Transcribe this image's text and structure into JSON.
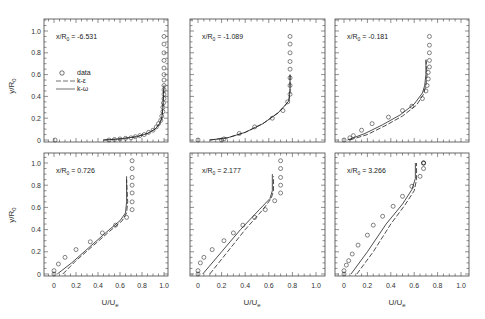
{
  "figure": {
    "ylabel": "y/R",
    "ylabel_sub": "0",
    "xlabel": "U/U",
    "xlabel_sub": "e",
    "legend": {
      "items": [
        {
          "label": "data",
          "style": "circle"
        },
        {
          "label": "k-ε",
          "style": "dashed"
        },
        {
          "label": "k-ω",
          "style": "solid"
        }
      ]
    }
  },
  "chart_data": [
    {
      "type": "line",
      "title": "x/R0 = -6.531",
      "annotation": "x/R",
      "annotation_sub": "0",
      "annotation_value": " = -6.531",
      "xlabel": "",
      "ylabel": "y/R0",
      "xlim": [
        -0.08,
        1.05
      ],
      "ylim": [
        0,
        1.1
      ],
      "yticks": [
        0,
        0.2,
        0.4,
        0.6,
        0.8,
        1.0
      ],
      "grid": false,
      "series": [
        {
          "name": "data",
          "x": [
            0.01,
            0.5,
            0.55,
            0.6,
            0.65,
            0.7,
            0.74,
            0.78,
            0.82,
            0.86,
            0.9,
            0.93,
            0.95,
            0.97,
            0.98,
            0.99,
            0.99,
            0.995,
            1.0,
            1.0,
            1.0,
            1.0,
            1.0,
            1.0,
            1.0,
            1.0,
            1.0,
            1.0,
            1.0
          ],
          "y": [
            0.0,
            0.0,
            0.005,
            0.01,
            0.015,
            0.02,
            0.03,
            0.04,
            0.05,
            0.07,
            0.09,
            0.12,
            0.15,
            0.18,
            0.22,
            0.26,
            0.3,
            0.34,
            0.38,
            0.42,
            0.46,
            0.5,
            0.55,
            0.6,
            0.66,
            0.73,
            0.8,
            0.88,
            0.95
          ]
        },
        {
          "name": "k-ε",
          "x": [
            0.45,
            0.6,
            0.75,
            0.85,
            0.92,
            0.96,
            0.98,
            0.99,
            0.995,
            1.0
          ],
          "y": [
            0.0,
            0.01,
            0.03,
            0.06,
            0.1,
            0.15,
            0.2,
            0.3,
            0.4,
            0.5
          ]
        },
        {
          "name": "k-ω",
          "x": [
            0.45,
            0.6,
            0.75,
            0.85,
            0.92,
            0.96,
            0.98,
            0.99,
            0.995,
            1.0
          ],
          "y": [
            0.0,
            0.01,
            0.03,
            0.06,
            0.1,
            0.15,
            0.2,
            0.3,
            0.4,
            0.5
          ]
        }
      ]
    },
    {
      "type": "line",
      "title": "x/R0 = -1.089",
      "annotation": "x/R",
      "annotation_sub": "0",
      "annotation_value": " = -1.089",
      "xlim": [
        -0.08,
        1.05
      ],
      "ylim": [
        0,
        1.1
      ],
      "series": [
        {
          "name": "data",
          "x": [
            0.0,
            0.2,
            0.22,
            0.35,
            0.48,
            0.63,
            0.72,
            0.76,
            0.78,
            0.78,
            0.78,
            0.78,
            0.78,
            0.78,
            0.78,
            0.78
          ],
          "y": [
            0.0,
            0.0,
            0.01,
            0.06,
            0.12,
            0.2,
            0.27,
            0.35,
            0.42,
            0.5,
            0.57,
            0.65,
            0.72,
            0.8,
            0.88,
            0.95
          ]
        },
        {
          "name": "k-ε",
          "x": [
            0.1,
            0.25,
            0.4,
            0.55,
            0.68,
            0.74,
            0.77,
            0.78,
            0.78
          ],
          "y": [
            0.0,
            0.02,
            0.07,
            0.15,
            0.25,
            0.32,
            0.36,
            0.45,
            0.6
          ]
        },
        {
          "name": "k-ω",
          "x": [
            0.1,
            0.25,
            0.4,
            0.55,
            0.68,
            0.74,
            0.77,
            0.78,
            0.78
          ],
          "y": [
            0.0,
            0.02,
            0.07,
            0.15,
            0.25,
            0.32,
            0.36,
            0.45,
            0.6
          ]
        }
      ]
    },
    {
      "type": "line",
      "title": "x/R0 = -0.181",
      "annotation": "x/R",
      "annotation_sub": "0",
      "annotation_value": " = -0.181",
      "xlim": [
        -0.08,
        1.05
      ],
      "ylim": [
        0,
        1.1
      ],
      "series": [
        {
          "name": "data",
          "x": [
            0.0,
            0.05,
            0.08,
            0.15,
            0.24,
            0.38,
            0.5,
            0.58,
            0.67,
            0.7,
            0.71,
            0.72,
            0.72,
            0.73,
            0.73,
            0.73,
            0.73,
            0.73
          ],
          "y": [
            0.0,
            0.02,
            0.04,
            0.09,
            0.15,
            0.21,
            0.27,
            0.31,
            0.38,
            0.45,
            0.5,
            0.56,
            0.62,
            0.67,
            0.73,
            0.8,
            0.87,
            0.95
          ]
        },
        {
          "name": "k-ε",
          "x": [
            0.05,
            0.2,
            0.35,
            0.5,
            0.62,
            0.68,
            0.7,
            0.71,
            0.7
          ],
          "y": [
            0.0,
            0.05,
            0.13,
            0.22,
            0.32,
            0.42,
            0.5,
            0.6,
            0.75
          ]
        },
        {
          "name": "k-ω",
          "x": [
            0.03,
            0.18,
            0.33,
            0.48,
            0.6,
            0.67,
            0.69,
            0.7,
            0.7
          ],
          "y": [
            0.0,
            0.06,
            0.14,
            0.23,
            0.33,
            0.43,
            0.5,
            0.6,
            0.73
          ]
        }
      ]
    },
    {
      "type": "line",
      "title": "x/R0 = 0.726",
      "annotation": "x/R",
      "annotation_sub": "0",
      "annotation_value": " = 0.726",
      "xlim": [
        -0.08,
        1.05
      ],
      "ylim": [
        0,
        1.1
      ],
      "xticks": [
        0,
        0.2,
        0.4,
        0.6,
        0.8,
        1.0
      ],
      "series": [
        {
          "name": "data",
          "x": [
            0.0,
            0.0,
            0.04,
            0.1,
            0.2,
            0.33,
            0.44,
            0.56,
            0.66,
            0.71,
            0.71,
            0.71,
            0.71,
            0.71,
            0.71,
            0.71
          ],
          "y": [
            0.0,
            0.03,
            0.09,
            0.15,
            0.22,
            0.29,
            0.37,
            0.44,
            0.51,
            0.58,
            0.65,
            0.73,
            0.8,
            0.87,
            0.95,
            1.02
          ]
        },
        {
          "name": "k-ε",
          "x": [
            0.08,
            0.2,
            0.35,
            0.5,
            0.62,
            0.66,
            0.67,
            0.66
          ],
          "y": [
            0.0,
            0.12,
            0.25,
            0.38,
            0.48,
            0.55,
            0.65,
            0.85
          ]
        },
        {
          "name": "k-ω",
          "x": [
            0.03,
            0.16,
            0.32,
            0.48,
            0.6,
            0.65,
            0.66,
            0.66
          ],
          "y": [
            0.0,
            0.1,
            0.24,
            0.38,
            0.48,
            0.55,
            0.65,
            0.88
          ]
        }
      ]
    },
    {
      "type": "line",
      "title": "x/R0 = 2.177",
      "annotation": "x/R",
      "annotation_sub": "0",
      "annotation_value": " = 2.177",
      "xlim": [
        -0.08,
        1.05
      ],
      "ylim": [
        0,
        1.1
      ],
      "xticks": [
        0,
        0.2,
        0.4,
        0.6,
        0.8,
        1.0
      ],
      "series": [
        {
          "name": "data",
          "x": [
            0.0,
            0.0,
            0.02,
            0.05,
            0.12,
            0.22,
            0.3,
            0.38,
            0.48,
            0.57,
            0.65,
            0.7,
            0.7,
            0.7,
            0.7,
            0.7
          ],
          "y": [
            0.0,
            0.03,
            0.1,
            0.15,
            0.22,
            0.3,
            0.37,
            0.44,
            0.51,
            0.58,
            0.66,
            0.73,
            0.8,
            0.87,
            0.95,
            1.02
          ]
        },
        {
          "name": "k-ε",
          "x": [
            0.1,
            0.25,
            0.4,
            0.55,
            0.62,
            0.64,
            0.64
          ],
          "y": [
            0.0,
            0.2,
            0.4,
            0.58,
            0.68,
            0.75,
            0.88
          ]
        },
        {
          "name": "k-ω",
          "x": [
            0.04,
            0.2,
            0.36,
            0.52,
            0.61,
            0.63,
            0.63
          ],
          "y": [
            0.0,
            0.2,
            0.4,
            0.58,
            0.68,
            0.75,
            0.9
          ]
        }
      ]
    },
    {
      "type": "line",
      "title": "x/R0 = 3.266",
      "annotation": "x/R",
      "annotation_sub": "0",
      "annotation_value": " = 3.266",
      "xlim": [
        -0.08,
        1.05
      ],
      "ylim": [
        0,
        1.1
      ],
      "xticks": [
        0,
        0.2,
        0.4,
        0.6,
        0.8,
        1.0
      ],
      "series": [
        {
          "name": "data",
          "x": [
            0.0,
            0.0,
            0.02,
            0.04,
            0.07,
            0.12,
            0.2,
            0.25,
            0.33,
            0.42,
            0.5,
            0.58,
            0.65,
            0.68,
            0.68,
            0.68,
            0.68
          ],
          "y": [
            0.0,
            0.03,
            0.08,
            0.12,
            0.18,
            0.26,
            0.35,
            0.44,
            0.52,
            0.61,
            0.7,
            0.79,
            0.88,
            0.95,
            1.0,
            1.0,
            1.0
          ]
        },
        {
          "name": "k-ε",
          "x": [
            0.11,
            0.25,
            0.4,
            0.52,
            0.6,
            0.62,
            0.62
          ],
          "y": [
            0.0,
            0.2,
            0.45,
            0.62,
            0.75,
            0.85,
            1.0
          ]
        },
        {
          "name": "k-ω",
          "x": [
            0.06,
            0.2,
            0.36,
            0.5,
            0.58,
            0.61,
            0.61
          ],
          "y": [
            0.0,
            0.2,
            0.45,
            0.63,
            0.76,
            0.86,
            1.0
          ]
        }
      ]
    }
  ]
}
